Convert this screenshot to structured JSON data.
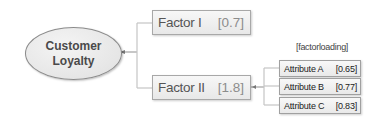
{
  "diagram": {
    "type": "mind-map",
    "root": {
      "label_line1": "Customer",
      "label_line2": "Loyalty"
    },
    "factors": [
      {
        "name": "Factor I",
        "value": "[0.7]"
      },
      {
        "name": "Factor II",
        "value": "[1.8]"
      }
    ],
    "factor_loading_label": "[factorloading]",
    "attributes": [
      {
        "name": "Attribute A",
        "value": "[0.65]"
      },
      {
        "name": "Attribute B",
        "value": "[0.77]"
      },
      {
        "name": "Attribute C",
        "value": "[0.83]"
      }
    ],
    "colors": {
      "node_fill": "#e8e8e8",
      "node_border": "#a8a8a8",
      "connector": "#b5b5b5",
      "text_dark": "#4a4a4a",
      "value_text": "#8c8c8c"
    }
  }
}
